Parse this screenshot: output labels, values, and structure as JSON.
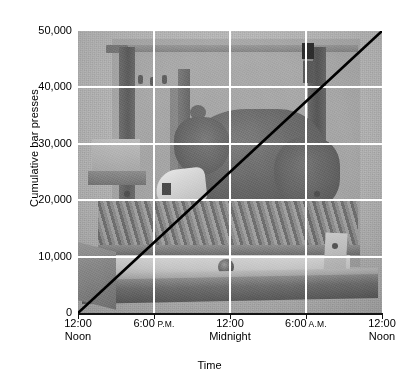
{
  "chart_data": {
    "type": "line",
    "title": "",
    "subtitle": "",
    "xlabel": "Time",
    "ylabel": "Cumulative bar presses",
    "ylim": [
      0,
      50000
    ],
    "yticks": [
      0,
      10000,
      20000,
      30000,
      40000,
      50000
    ],
    "ytick_labels": [
      "0",
      "10,000",
      "20,000",
      "30,000",
      "40,000",
      "50,000"
    ],
    "xticks": [
      0,
      6,
      12,
      18,
      24
    ],
    "xtick_labels": [
      {
        "line1": "12:00",
        "line2": "Noon",
        "suffix": ""
      },
      {
        "line1": "6:00",
        "line2": "",
        "suffix": "P.M."
      },
      {
        "line1": "12:00",
        "line2": "Midnight",
        "suffix": ""
      },
      {
        "line1": "6:00",
        "line2": "",
        "suffix": "A.M."
      },
      {
        "line1": "12:00",
        "line2": "Noon",
        "suffix": ""
      }
    ],
    "xlim_hours": [
      0,
      24
    ],
    "grid": true,
    "grid_color": "#ffffff",
    "legend": "none",
    "background_image": "rat-in-operant-conditioning-chamber-photograph",
    "series": [
      {
        "name": "Cumulative bar presses",
        "color": "#000000",
        "line_width": 2.6,
        "x": [
          0,
          3,
          6,
          9,
          12,
          15,
          18,
          21,
          24
        ],
        "y": [
          0,
          6250,
          12500,
          18750,
          25000,
          31250,
          37500,
          43750,
          50000
        ]
      }
    ]
  },
  "axes": {
    "y_axis_title": "Cumulative bar presses",
    "x_axis_title": "Time"
  },
  "photo": {
    "alt": "Laboratory rat pressing a lever inside a Skinner box operant conditioning chamber",
    "caption": ""
  },
  "colors": {
    "plot_background": "#b5b5b5",
    "gridline": "#ffffff",
    "data_line": "#000000",
    "axis": "#141414",
    "text": "#000000",
    "page_background": "#ffffff"
  }
}
